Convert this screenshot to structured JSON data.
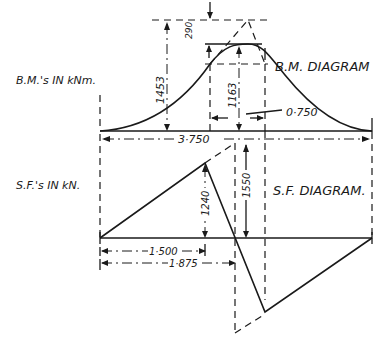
{
  "bm_diagram": {
    "title": "B.M. DIAGRAM",
    "units_label": "B.M.'s IN kNm.",
    "dimensions": {
      "max_moment_triangle": "1453",
      "reduction": "290",
      "actual_max_moment": "1163",
      "offset": "0·750",
      "span": "3·750"
    }
  },
  "sf_diagram": {
    "title": "S.F. DIAGRAM.",
    "units_label": "S.F.'s IN kN.",
    "dimensions": {
      "peak_shear": "1240",
      "jump_shear": "1550",
      "dist_a": "1·500",
      "dist_b": "1·875"
    }
  }
}
